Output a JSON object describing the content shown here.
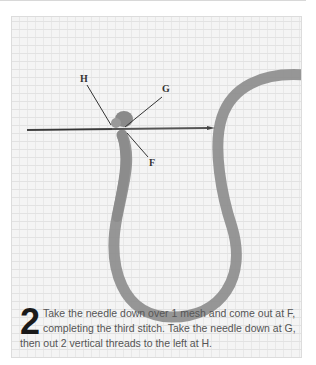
{
  "figure": {
    "labels": {
      "h": "H",
      "g": "G",
      "f": "F"
    },
    "yarn_color": "#8a8a8a",
    "canvas_color": "#f4f4f4",
    "needle_color": "#555555"
  },
  "caption": {
    "step_number": "2",
    "text": "Take the needle down over 1 mesh and come out at F, completing the third stitch. Take the needle down at G, then out 2 vertical threads to the left at H."
  }
}
